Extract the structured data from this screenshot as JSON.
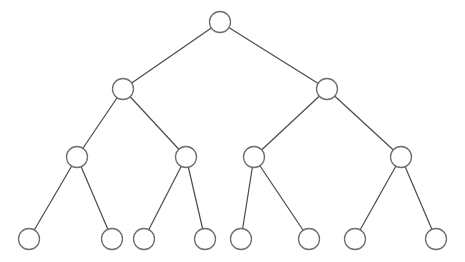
{
  "diagram": {
    "type": "binary-tree",
    "levels": 4,
    "style": {
      "edge_color": "#4a4a4a",
      "node_stroke": "#6e6e6e",
      "node_fill": "#ffffff",
      "background": "#ffffff",
      "node_radius": 10.5
    },
    "nodes": [
      {
        "id": "n0",
        "level": 0,
        "x": 220,
        "y": 22
      },
      {
        "id": "n1",
        "level": 1,
        "x": 123,
        "y": 89
      },
      {
        "id": "n2",
        "level": 1,
        "x": 327,
        "y": 89
      },
      {
        "id": "n3",
        "level": 2,
        "x": 77,
        "y": 157
      },
      {
        "id": "n4",
        "level": 2,
        "x": 186,
        "y": 157
      },
      {
        "id": "n5",
        "level": 2,
        "x": 254,
        "y": 157
      },
      {
        "id": "n6",
        "level": 2,
        "x": 401,
        "y": 157
      },
      {
        "id": "n7",
        "level": 3,
        "x": 29,
        "y": 239
      },
      {
        "id": "n8",
        "level": 3,
        "x": 112,
        "y": 239
      },
      {
        "id": "n9",
        "level": 3,
        "x": 144,
        "y": 239
      },
      {
        "id": "n10",
        "level": 3,
        "x": 205,
        "y": 239
      },
      {
        "id": "n11",
        "level": 3,
        "x": 241,
        "y": 239
      },
      {
        "id": "n12",
        "level": 3,
        "x": 309,
        "y": 239
      },
      {
        "id": "n13",
        "level": 3,
        "x": 355,
        "y": 239
      },
      {
        "id": "n14",
        "level": 3,
        "x": 436,
        "y": 239
      }
    ],
    "edges": [
      [
        "n0",
        "n1"
      ],
      [
        "n0",
        "n2"
      ],
      [
        "n1",
        "n3"
      ],
      [
        "n1",
        "n4"
      ],
      [
        "n2",
        "n5"
      ],
      [
        "n2",
        "n6"
      ],
      [
        "n3",
        "n7"
      ],
      [
        "n3",
        "n8"
      ],
      [
        "n4",
        "n9"
      ],
      [
        "n4",
        "n10"
      ],
      [
        "n5",
        "n11"
      ],
      [
        "n5",
        "n12"
      ],
      [
        "n6",
        "n13"
      ],
      [
        "n6",
        "n14"
      ]
    ]
  }
}
